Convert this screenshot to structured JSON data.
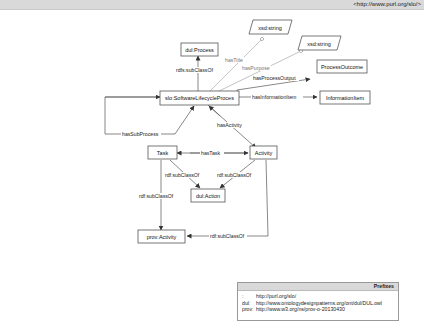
{
  "header": {
    "namespace": "<http://www.purl.org/slo/>"
  },
  "nodes": {
    "xsd_string_1": "xsd:string",
    "xsd_string_2": "xsd:string",
    "dul_process": "dul:Process",
    "process_outcome": "ProcessOutcome",
    "software_lifecycle_process": "slo:SoftwareLifecycleProces",
    "information_item": "InformationItem",
    "task": "Task",
    "activity": "Activity",
    "dul_action": "dul:Action",
    "prov_activity": "prov:Activity"
  },
  "edges": {
    "has_title": "hasTitle",
    "has_purpose": "hasPurpose",
    "has_process_output": "hasProcessOutput",
    "subclass_process": "rdfs:subClassOf",
    "has_information_item": "hasInformationItem",
    "has_sub_process": "hasSubProcess",
    "has_activity": "hasActivity",
    "has_task": "hasTask",
    "task_subclass_action": "rdf:subClassOf",
    "activity_subclass_action": "rdf:subClassOf",
    "task_subclass_prov": "rdf:subClassOf",
    "activity_subclass_prov": "rdf:subClassOf"
  },
  "prefixes": {
    "title": "Prefixes",
    "rows": [
      {
        "key": ":",
        "value": "http://purl.org/slo/"
      },
      {
        "key": "dul:",
        "value": "http://www.ontologydesignpatterns.org/ont/dul/DUL.owl"
      },
      {
        "key": "prov:",
        "value": "http://www.w3.org/ns/prov-o-20130430"
      }
    ]
  }
}
